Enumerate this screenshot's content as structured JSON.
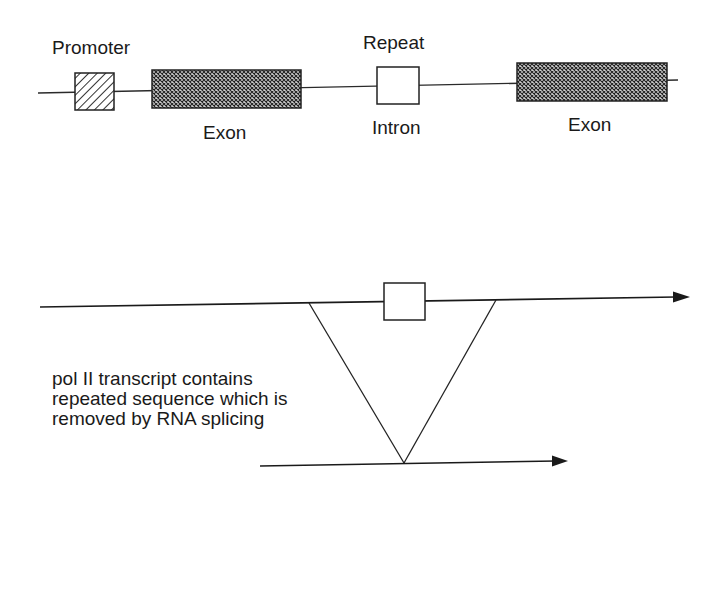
{
  "gene_map": {
    "labels": {
      "promoter": "Promoter",
      "repeat": "Repeat",
      "exon1": "Exon",
      "intron": "Intron",
      "exon2": "Exon"
    },
    "colors": {
      "line": "#2a2a2a",
      "hatch": "#333333",
      "exon_fill": "#3a3a3a",
      "background": "#ffffff"
    }
  },
  "splicing": {
    "note_lines": [
      "pol II transcript contains",
      "repeated sequence which is",
      "removed by RNA splicing"
    ]
  }
}
